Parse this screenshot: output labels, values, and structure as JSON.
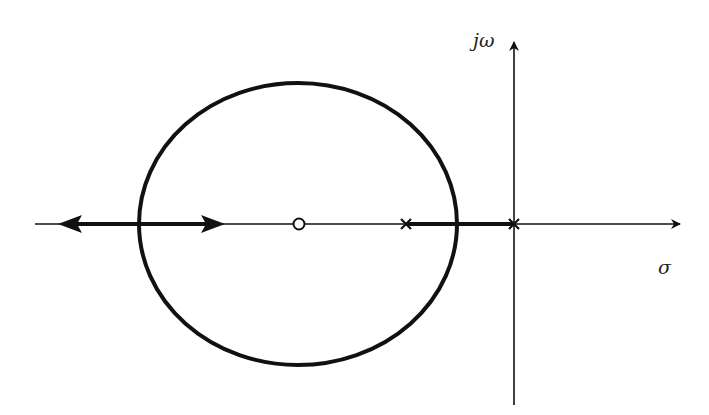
{
  "diagram": {
    "type": "root-locus",
    "axes": {
      "imaginary_label": "jω",
      "real_label": "σ"
    },
    "poles": [
      {
        "label": "pole-1",
        "x": 406,
        "y": 224
      },
      {
        "label": "pole-2-origin",
        "x": 514,
        "y": 224
      }
    ],
    "zeros": [
      {
        "label": "zero-1",
        "x": 299,
        "y": 224
      }
    ],
    "locus_circle": {
      "cx": 298,
      "cy": 224,
      "rx": 159,
      "ry": 141
    },
    "colors": {
      "stroke": "#111111",
      "background": "#ffffff"
    }
  }
}
